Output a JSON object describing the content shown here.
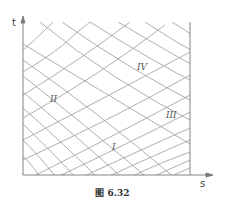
{
  "figure": {
    "caption": "图 6.32",
    "axes": {
      "x_label": "s",
      "y_label": "t"
    },
    "regions": [
      {
        "label": "I",
        "x": 112,
        "y": 150
      },
      {
        "label": "II",
        "x": 52,
        "y": 102
      },
      {
        "label": "III",
        "x": 170,
        "y": 118
      },
      {
        "label": "IV",
        "x": 140,
        "y": 70
      }
    ],
    "colors": {
      "axis": "#777777",
      "grid": "#9a9a9a",
      "text": "#444444"
    }
  }
}
